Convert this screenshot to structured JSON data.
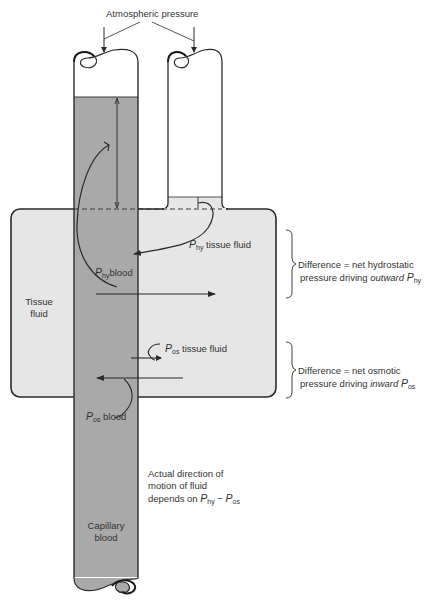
{
  "figure": {
    "title": "Atmospheric pressure",
    "colors": {
      "capillary_blood": "#a9a9a9",
      "tissue_fluid": "#e6e6e6",
      "outline": "#2b2b2b",
      "background": "#ffffff"
    },
    "labels": {
      "atmospheric_pressure": "Atmospheric pressure",
      "tissue_fluid_line1": "Tissue",
      "tissue_fluid_line2": "fluid",
      "capillary_line1": "Capillary",
      "capillary_line2": "blood",
      "p_symbol": "P",
      "hy_sub": "hy",
      "os_sub": "os",
      "p_hy_tissue_suffix": " tissue fluid",
      "p_hy_blood_suffix": "blood",
      "p_os_tissue_suffix": " tissue fluid",
      "p_os_blood_suffix": " blood"
    },
    "annotations": {
      "hydrostatic_line1": "Difference = net hydrostatic",
      "hydrostatic_line2_prefix": "pressure driving ",
      "hydrostatic_direction": "outward",
      "osmotic_line1": "Difference = net osmotic",
      "osmotic_line2_prefix": "pressure driving ",
      "osmotic_direction": "inward",
      "actual_line1": "Actual direction of",
      "actual_line2": "motion of fluid",
      "actual_line3_prefix": "depends on ",
      "minus": " − "
    }
  }
}
